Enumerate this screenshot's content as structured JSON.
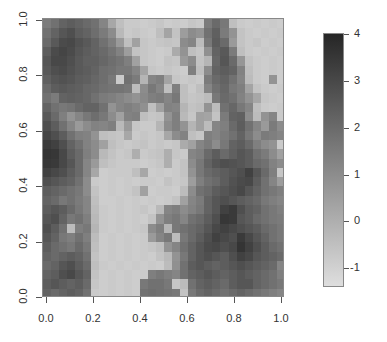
{
  "chart_data": {
    "type": "heatmap",
    "title": "",
    "xlabel": "",
    "ylabel": "",
    "xlim": [
      0,
      1
    ],
    "ylim": [
      0,
      1
    ],
    "x_ticks": [
      "0.0",
      "0.2",
      "0.4",
      "0.6",
      "0.8",
      "1.0"
    ],
    "y_ticks": [
      "0.0",
      "0.2",
      "0.4",
      "0.6",
      "0.8",
      "1.0"
    ],
    "colorbar": {
      "ticks": [
        "4",
        "3",
        "2",
        "1",
        "0",
        "-1"
      ],
      "range": [
        -1.4,
        4
      ],
      "low_color": "#dedede",
      "high_color": "#262626"
    },
    "grid_rows_top_to_bottom": [
      [
        1.5,
        1.8,
        2.2,
        2.4,
        2.2,
        2.0,
        1.8,
        1.2,
        0.2,
        -0.5,
        -0.8,
        -0.8,
        -0.9,
        -0.8,
        -0.7,
        -0.9,
        -0.8,
        -0.9,
        -0.7,
        -0.8,
        1.5,
        2.0,
        1.6,
        -0.5,
        -0.8,
        -0.9,
        -0.8,
        -0.9,
        -0.8,
        -0.9
      ],
      [
        1.8,
        2.2,
        2.6,
        2.8,
        2.4,
        2.2,
        1.9,
        1.5,
        1.0,
        -0.3,
        -0.8,
        -0.7,
        -0.8,
        -0.9,
        -0.5,
        0.3,
        -0.6,
        0.5,
        1.0,
        0.8,
        1.8,
        2.3,
        1.5,
        0.8,
        -0.6,
        -0.8,
        -0.9,
        -0.8,
        -0.9,
        -0.8
      ],
      [
        2.0,
        2.5,
        2.9,
        3.0,
        2.7,
        2.5,
        2.2,
        1.8,
        1.4,
        0.6,
        -0.5,
        0.4,
        -0.7,
        -0.8,
        -0.7,
        -0.6,
        -0.7,
        1.0,
        1.2,
        -0.4,
        1.6,
        2.4,
        2.0,
        0.6,
        -0.6,
        -0.8,
        -0.7,
        -0.9,
        -0.8,
        -0.9
      ],
      [
        2.4,
        2.9,
        3.1,
        2.9,
        2.6,
        2.4,
        2.2,
        2.0,
        1.7,
        1.3,
        0.5,
        -0.6,
        -0.7,
        -0.8,
        -0.9,
        -0.8,
        0.1,
        0.8,
        -0.5,
        -0.7,
        0.9,
        2.2,
        2.5,
        1.5,
        -0.5,
        -0.8,
        -0.9,
        -0.8,
        -0.9,
        -0.8
      ],
      [
        2.6,
        3.0,
        3.0,
        2.8,
        2.5,
        2.3,
        2.3,
        2.1,
        1.9,
        1.7,
        1.4,
        0.4,
        -0.7,
        -0.8,
        -0.9,
        -0.6,
        -0.7,
        0.6,
        1.0,
        -0.6,
        -0.2,
        2.1,
        2.6,
        2.0,
        0.7,
        -0.6,
        -0.8,
        -0.9,
        -0.8,
        -0.9
      ],
      [
        2.5,
        2.8,
        2.9,
        2.7,
        2.5,
        2.4,
        2.2,
        1.9,
        1.8,
        1.6,
        1.6,
        1.2,
        0.3,
        -0.7,
        -0.8,
        -0.7,
        -0.8,
        -0.9,
        1.4,
        -0.5,
        1.0,
        2.2,
        2.4,
        2.2,
        1.3,
        -0.5,
        -0.8,
        -0.9,
        -0.8,
        -0.9
      ],
      [
        2.3,
        2.6,
        2.7,
        2.6,
        2.4,
        2.3,
        2.1,
        1.9,
        1.6,
        -0.8,
        1.8,
        1.5,
        -0.2,
        1.2,
        1.4,
        0.3,
        -0.7,
        -0.8,
        -0.7,
        -0.8,
        1.5,
        2.0,
        2.2,
        1.8,
        1.2,
        -0.4,
        -0.8,
        -0.9,
        0.8,
        -0.9
      ],
      [
        2.0,
        2.4,
        2.5,
        2.4,
        2.3,
        2.1,
        2.0,
        1.8,
        1.7,
        1.7,
        1.6,
        -0.4,
        1.0,
        1.6,
        1.2,
        -0.5,
        1.4,
        -0.5,
        -0.8,
        -0.5,
        1.2,
        1.8,
        2.1,
        1.6,
        1.4,
        0.3,
        -0.6,
        -0.8,
        -0.9,
        -0.8
      ],
      [
        1.8,
        1.5,
        2.2,
        2.3,
        2.2,
        2.1,
        1.8,
        1.5,
        1.4,
        1.2,
        1.0,
        0.8,
        1.1,
        1.4,
        1.5,
        1.2,
        1.6,
        -0.5,
        -0.7,
        -0.6,
        -0.4,
        1.6,
        2.0,
        1.8,
        1.3,
        0.8,
        0.2,
        -0.7,
        -0.8,
        -0.9
      ],
      [
        2.2,
        1.8,
        1.6,
        1.7,
        2.0,
        2.2,
        2.2,
        1.8,
        0.8,
        1.2,
        1.4,
        1.2,
        0.9,
        -0.5,
        0.4,
        1.3,
        1.2,
        -0.2,
        -0.6,
        -0.5,
        0.8,
        -0.4,
        1.8,
        2.1,
        1.6,
        1.2,
        -0.5,
        -0.8,
        -0.9,
        -0.8
      ],
      [
        2.5,
        2.0,
        1.4,
        0.8,
        1.2,
        1.6,
        1.9,
        1.6,
        1.0,
        0.4,
        1.3,
        1.4,
        -0.5,
        -0.7,
        -0.6,
        0.8,
        1.4,
        -0.3,
        -0.7,
        0.4,
        0.3,
        -0.6,
        1.5,
        2.2,
        2.3,
        1.0,
        -0.4,
        0.8,
        1.2,
        -0.8
      ],
      [
        2.8,
        2.4,
        1.8,
        1.2,
        0.6,
        1.0,
        1.3,
        1.2,
        1.4,
        -0.3,
        0.6,
        -0.7,
        -0.8,
        -0.8,
        -0.2,
        1.0,
        1.4,
        0.8,
        -0.2,
        0.4,
        -0.4,
        1.2,
        1.4,
        2.0,
        2.4,
        1.8,
        1.2,
        0.6,
        1.5,
        1.0
      ],
      [
        3.1,
        2.8,
        2.4,
        1.8,
        1.4,
        1.3,
        0.8,
        -0.5,
        -0.6,
        -0.7,
        0.2,
        -0.8,
        -0.7,
        -0.8,
        -0.7,
        0.2,
        1.0,
        1.3,
        -0.5,
        -0.7,
        1.4,
        1.2,
        1.5,
        1.8,
        2.2,
        1.6,
        1.0,
        1.5,
        1.4,
        1.2
      ],
      [
        3.4,
        3.2,
        2.8,
        2.2,
        1.8,
        1.3,
        1.0,
        0.4,
        -0.5,
        -0.7,
        -0.8,
        -0.7,
        -0.6,
        -0.8,
        -0.7,
        -0.8,
        -0.7,
        0.1,
        0.4,
        1.2,
        1.5,
        1.0,
        1.6,
        2.2,
        2.4,
        2.0,
        1.4,
        1.0,
        0.8,
        -0.8
      ],
      [
        3.6,
        3.5,
        3.0,
        2.4,
        2.0,
        1.4,
        1.0,
        -0.3,
        -0.6,
        -0.8,
        -0.7,
        0.0,
        -0.8,
        -0.7,
        -0.6,
        0.0,
        -0.7,
        -0.8,
        1.2,
        1.4,
        2.0,
        2.4,
        2.0,
        2.3,
        2.6,
        2.4,
        1.8,
        1.5,
        1.0,
        0.4
      ],
      [
        3.5,
        3.4,
        3.0,
        2.6,
        2.0,
        1.2,
        0.6,
        -0.5,
        -0.7,
        -0.8,
        -0.8,
        -0.8,
        -0.9,
        -0.8,
        -0.7,
        0.0,
        -0.8,
        -0.6,
        1.0,
        1.6,
        2.2,
        2.6,
        2.8,
        2.7,
        2.6,
        2.4,
        2.0,
        1.8,
        1.3,
        1.0
      ],
      [
        3.2,
        3.0,
        2.8,
        2.4,
        2.0,
        1.2,
        0.2,
        -0.9,
        -0.8,
        -0.8,
        -0.8,
        -0.5,
        0.2,
        -0.9,
        -0.8,
        -0.9,
        -0.8,
        -0.6,
        0.8,
        1.6,
        2.0,
        2.2,
        2.4,
        2.6,
        2.8,
        3.2,
        2.6,
        2.0,
        1.4,
        -0.7
      ],
      [
        2.8,
        2.6,
        2.4,
        2.2,
        1.8,
        1.0,
        -0.8,
        -0.9,
        -0.8,
        -0.9,
        -0.8,
        -0.9,
        -0.8,
        -0.8,
        -0.9,
        -0.6,
        -0.8,
        -0.7,
        0.5,
        1.4,
        1.8,
        2.0,
        2.4,
        2.7,
        2.9,
        3.0,
        2.4,
        1.8,
        1.2,
        0.5
      ],
      [
        2.4,
        2.2,
        2.0,
        1.8,
        1.6,
        1.0,
        -0.6,
        -0.9,
        -0.8,
        -0.9,
        -0.8,
        -0.6,
        0.4,
        -0.9,
        -0.8,
        -0.8,
        -0.9,
        -0.4,
        1.0,
        1.8,
        2.0,
        2.4,
        2.6,
        2.8,
        3.0,
        2.6,
        2.2,
        1.8,
        1.6,
        1.4
      ],
      [
        2.2,
        2.0,
        1.6,
        1.8,
        1.5,
        1.2,
        -0.5,
        -0.9,
        -0.9,
        -0.8,
        -0.9,
        -0.8,
        -0.9,
        -0.8,
        -0.9,
        -0.8,
        -0.6,
        0.4,
        1.2,
        1.5,
        2.2,
        2.6,
        2.8,
        2.6,
        2.4,
        2.2,
        2.0,
        1.6,
        1.4,
        1.2
      ],
      [
        2.4,
        2.6,
        2.4,
        2.0,
        1.6,
        1.2,
        -0.4,
        -0.8,
        -0.9,
        -0.8,
        -0.9,
        -0.8,
        -0.7,
        -0.9,
        -0.3,
        1.2,
        1.4,
        1.0,
        1.3,
        1.6,
        2.2,
        2.6,
        3.2,
        3.4,
        2.8,
        2.4,
        2.2,
        1.8,
        1.6,
        1.4
      ],
      [
        2.6,
        2.8,
        2.2,
        1.6,
        1.8,
        1.4,
        -0.3,
        -0.8,
        -0.9,
        -0.8,
        -0.9,
        -0.8,
        -0.9,
        -0.6,
        0.8,
        1.4,
        1.6,
        1.2,
        1.8,
        2.0,
        2.4,
        2.8,
        3.5,
        3.4,
        2.6,
        2.4,
        2.0,
        1.8,
        1.6,
        1.5
      ],
      [
        2.8,
        2.4,
        1.8,
        -0.4,
        1.4,
        1.6,
        -0.2,
        -0.8,
        -0.9,
        -0.8,
        -0.9,
        -0.8,
        -0.7,
        1.0,
        1.4,
        -0.2,
        1.6,
        1.8,
        2.0,
        2.2,
        2.6,
        3.0,
        3.2,
        3.0,
        2.8,
        2.6,
        2.4,
        2.0,
        1.8,
        1.6
      ],
      [
        2.6,
        2.2,
        1.6,
        1.4,
        1.8,
        1.4,
        -0.4,
        -0.9,
        -0.8,
        -0.9,
        -0.8,
        -0.9,
        -0.8,
        0.6,
        1.2,
        1.6,
        -0.4,
        1.6,
        2.0,
        2.4,
        2.8,
        3.2,
        3.0,
        2.8,
        3.4,
        3.0,
        2.6,
        2.2,
        1.8,
        1.6
      ],
      [
        2.4,
        2.0,
        1.8,
        1.6,
        2.0,
        1.6,
        -0.5,
        -0.9,
        -0.8,
        -0.9,
        -0.8,
        -0.9,
        -0.8,
        -0.7,
        -0.5,
        0.8,
        1.2,
        1.8,
        2.2,
        2.6,
        2.9,
        3.0,
        2.8,
        3.0,
        3.6,
        3.2,
        2.8,
        2.4,
        2.0,
        1.8
      ],
      [
        2.2,
        2.0,
        2.2,
        2.4,
        2.2,
        1.8,
        -0.6,
        -0.9,
        -0.8,
        -0.9,
        -0.8,
        -0.9,
        -0.8,
        -0.9,
        -0.6,
        -0.3,
        0.8,
        1.6,
        2.2,
        2.6,
        2.8,
        2.6,
        2.4,
        2.8,
        3.2,
        3.0,
        2.6,
        2.4,
        2.2,
        2.0
      ],
      [
        2.0,
        2.2,
        2.6,
        2.8,
        2.4,
        2.0,
        -0.5,
        -0.8,
        -0.9,
        -0.8,
        -0.9,
        -0.8,
        -0.9,
        -0.8,
        -0.9,
        -0.4,
        0.9,
        1.8,
        2.4,
        2.6,
        2.4,
        2.2,
        2.4,
        2.6,
        2.8,
        2.6,
        2.4,
        2.2,
        2.0,
        1.2
      ],
      [
        2.2,
        2.4,
        2.8,
        3.0,
        2.6,
        2.2,
        -0.6,
        -0.9,
        -0.8,
        -0.9,
        -0.8,
        -0.9,
        -0.8,
        1.4,
        1.6,
        1.4,
        1.2,
        1.8,
        2.2,
        2.4,
        2.6,
        2.4,
        2.2,
        2.4,
        2.6,
        2.4,
        2.2,
        2.0,
        1.8,
        1.4
      ],
      [
        2.4,
        2.6,
        2.4,
        2.2,
        2.4,
        2.0,
        -0.7,
        -0.9,
        -0.8,
        -0.9,
        -0.8,
        -0.9,
        1.6,
        1.8,
        1.8,
        1.6,
        -0.7,
        -0.4,
        1.8,
        2.2,
        2.4,
        2.2,
        2.0,
        2.4,
        2.6,
        2.6,
        2.2,
        2.0,
        1.8,
        1.6
      ],
      [
        2.2,
        2.0,
        2.2,
        2.4,
        2.2,
        1.8,
        -0.8,
        -0.9,
        -0.8,
        -0.9,
        -0.8,
        -0.9,
        1.8,
        1.9,
        1.8,
        1.7,
        1.6,
        -0.6,
        1.6,
        2.0,
        2.2,
        2.0,
        1.8,
        2.0,
        2.2,
        2.0,
        1.8,
        1.6,
        1.4,
        1.2
      ]
    ]
  },
  "axes": {
    "x_labels": [
      "0.0",
      "0.2",
      "0.4",
      "0.6",
      "0.8",
      "1.0"
    ],
    "y_labels": [
      "0.0",
      "0.2",
      "0.4",
      "0.6",
      "0.8",
      "1.0"
    ],
    "colorbar_labels": [
      "4",
      "3",
      "2",
      "1",
      "0",
      "-1"
    ]
  }
}
